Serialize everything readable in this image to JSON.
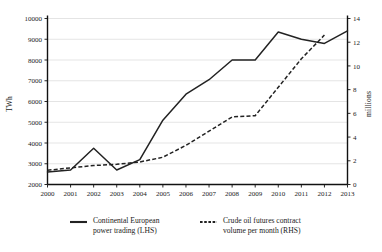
{
  "chart_data": {
    "type": "line",
    "title": "",
    "subtitle": "",
    "xlabel": "",
    "ylabel": "TWh",
    "y2label": "millions",
    "grid": true,
    "legend_position": "bottom",
    "x": [
      2000,
      2001,
      2002,
      2003,
      2004,
      2005,
      2006,
      2007,
      2008,
      2009,
      2010,
      2011,
      2012,
      2013
    ],
    "categories": [
      "2000",
      "2001",
      "2002",
      "2003",
      "2004",
      "2005",
      "2006",
      "2007",
      "2008",
      "2009",
      "2010",
      "2011",
      "2012",
      "2013"
    ],
    "ylim": [
      2000,
      10000
    ],
    "yticks": [
      2000,
      3000,
      4000,
      5000,
      6000,
      7000,
      8000,
      9000,
      10000
    ],
    "ytick_labels": [
      "2000",
      "3000",
      "4000",
      "5000",
      "6000",
      "7000",
      "8000",
      "9000",
      "10000"
    ],
    "y2lim": [
      0,
      14
    ],
    "y2ticks": [
      0,
      2,
      4,
      6,
      8,
      10,
      12,
      14
    ],
    "y2tick_labels": [
      "0",
      "2",
      "4",
      "6",
      "8",
      "10",
      "12",
      "14"
    ],
    "series": [
      {
        "name": "Continental European power trading (LHS)",
        "axis": "left",
        "style": "solid",
        "color": "#222222",
        "x": [
          2000,
          2001,
          2002,
          2003,
          2004,
          2005,
          2006,
          2007,
          2008,
          2009,
          2010,
          2011,
          2012,
          2013
        ],
        "values": [
          2600,
          2700,
          3750,
          2700,
          3200,
          5100,
          6350,
          7050,
          8000,
          8000,
          9350,
          9000,
          8800,
          9400
        ]
      },
      {
        "name": "Crude oil futures contract volume per month (RHS)",
        "axis": "right",
        "style": "dashed",
        "color": "#222222",
        "x": [
          2000,
          2001,
          2002,
          2003,
          2004,
          2005,
          2006,
          2007,
          2008,
          2009,
          2010,
          2011,
          2012
        ],
        "values": [
          1.2,
          1.4,
          1.6,
          1.7,
          1.9,
          2.3,
          3.3,
          4.5,
          5.7,
          5.8,
          8.2,
          10.6,
          12.6
        ]
      }
    ],
    "annotations": []
  },
  "legend": {
    "items": [
      {
        "label_line1": "Continental European",
        "label_line2": "power trading (LHS)",
        "style": "solid"
      },
      {
        "label_line1": "Crude oil futures contract",
        "label_line2": "volume per month (RHS)",
        "style": "dashed"
      }
    ]
  },
  "axes": {
    "left_title": "TWh",
    "right_title": "millions"
  }
}
